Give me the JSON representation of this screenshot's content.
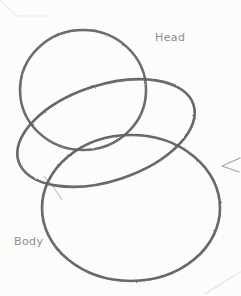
{
  "artwork": {
    "medium": "pencil-sketch",
    "background_color": "#fcfcfb",
    "stroke_color": "#5a5a5a",
    "stroke_color_light": "#8d8d8d",
    "label_color": "#8d8d8d",
    "width": 241,
    "height": 296
  },
  "labels": {
    "head": "Head",
    "body": "Body"
  },
  "shapes": {
    "head_circle": {
      "name": "head-construction-circle",
      "cx": 83,
      "cy": 90,
      "rx": 63,
      "ry": 60,
      "rotation": 0
    },
    "middle_ellipse": {
      "name": "middle-construction-ellipse",
      "cx": 106,
      "cy": 133,
      "rx": 92,
      "ry": 48,
      "rotation": -18
    },
    "body_circle": {
      "name": "body-construction-circle",
      "cx": 131,
      "cy": 208,
      "rx": 89,
      "ry": 73,
      "rotation": 0
    }
  },
  "marks": {
    "corner_line_top_left": "faint-diagonal-paper-edge",
    "corner_line_bottom_right": "faint-diagonal-paper-edge",
    "right_edge_chevron": "small-pencil-chevron-mark"
  }
}
